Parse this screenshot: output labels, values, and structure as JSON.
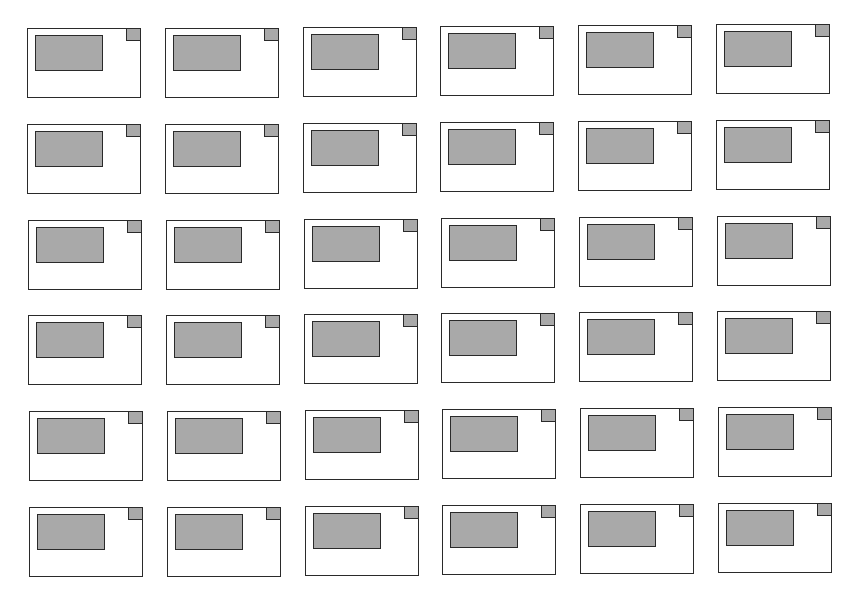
{
  "grid": {
    "rows": 6,
    "columns": 6,
    "card_count": 36,
    "colors": {
      "card_fill": "#ffffff",
      "outline": "#2a2a2a",
      "block_fill": "#a9a9a9",
      "corner_fill": "#a9a9a9"
    }
  }
}
